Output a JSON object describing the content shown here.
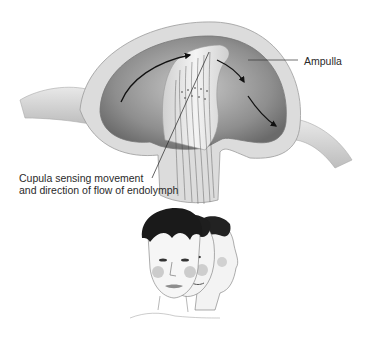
{
  "figure": {
    "labels": {
      "ampulla": "Ampulla",
      "cupula_line1": "Cupula sensing movement",
      "cupula_line2": "and direction of flow of endolymph"
    },
    "colors": {
      "canal_outer": "#d8d8d8",
      "canal_inner": "#8a8a8a",
      "cupula": "#e6e6e6",
      "arrow": "#111111",
      "hair": "#1c1c1c",
      "skin": "#f2f2f2",
      "cheek": "#b9b9b9"
    },
    "flow_arrows": 3,
    "head_positions": 3
  }
}
